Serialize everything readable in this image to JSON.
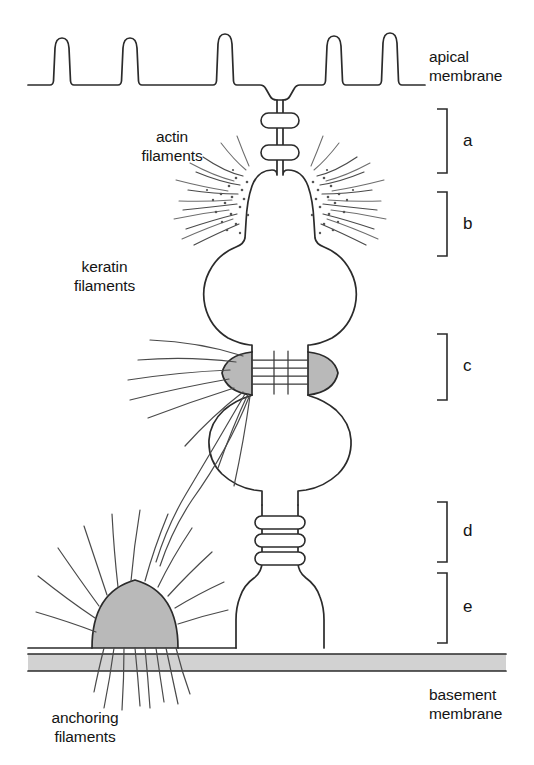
{
  "figure": {
    "background_color": "#ffffff",
    "ink_color": "#2b2b2b",
    "plaque_fill": "#b9b9b9",
    "basement_membrane_fill": "#d2d2d2"
  },
  "labels": {
    "apical_membrane_line1": "apical",
    "apical_membrane_line2": "membrane",
    "actin_filaments_line1": "actin",
    "actin_filaments_line2": "filaments",
    "keratin_filaments_line1": "keratin",
    "keratin_filaments_line2": "filaments",
    "anchoring_filaments_line1": "anchoring",
    "anchoring_filaments_line2": "filaments",
    "basement_membrane_line1": "basement",
    "basement_membrane_line2": "membrane"
  },
  "brackets": [
    {
      "id": "a",
      "letter": "a",
      "junction": "tight junction"
    },
    {
      "id": "b",
      "letter": "b",
      "junction": "adherens junction / zonula adherens"
    },
    {
      "id": "c",
      "letter": "c",
      "junction": "desmosome"
    },
    {
      "id": "d",
      "letter": "d",
      "junction": "gap junction"
    },
    {
      "id": "e",
      "letter": "e",
      "junction": "hemidesmosome"
    }
  ],
  "ghost_caption": "of    The weakest in the membrane, and"
}
